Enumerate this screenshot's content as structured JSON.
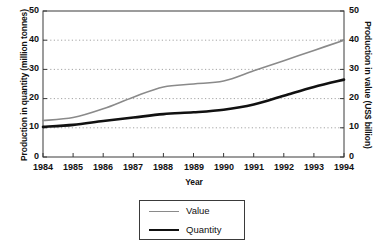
{
  "chart_data": {
    "type": "line",
    "title": "",
    "xlabel": "Year",
    "ylabel": "Production in quantity (million tonnes)",
    "ylabel_right": "Production in value (US$ billion)",
    "categories": [
      "1984",
      "1985",
      "1986",
      "1987",
      "1988",
      "1989",
      "1990",
      "1991",
      "1992",
      "1993",
      "1994"
    ],
    "x": [
      1984,
      1985,
      1986,
      1987,
      1988,
      1989,
      1990,
      1991,
      1992,
      1993,
      1994
    ],
    "xlim": [
      1984,
      1994
    ],
    "ylim": [
      0,
      50
    ],
    "ylim_right": [
      0,
      50
    ],
    "yticks": [
      0,
      10,
      20,
      30,
      40,
      50
    ],
    "yticks_right": [
      0,
      10,
      20,
      30,
      40,
      50
    ],
    "grid": true,
    "grid_style": "dotted-horizontal",
    "legend_position": "below-axes-center",
    "series": [
      {
        "name": "Value",
        "axis": "right",
        "unit": "US$ billion",
        "color": "#8a8a8a",
        "width": 1.6,
        "values": [
          12.5,
          13.5,
          16.5,
          20.5,
          24.0,
          25.0,
          26.0,
          29.5,
          33.0,
          36.5,
          40.0
        ]
      },
      {
        "name": "Quantity",
        "axis": "left",
        "unit": "million tonnes",
        "color": "#111111",
        "width": 2.6,
        "values": [
          10.3,
          11.0,
          12.3,
          13.5,
          14.7,
          15.3,
          16.2,
          18.0,
          21.0,
          24.0,
          26.5
        ]
      }
    ]
  },
  "axes": {
    "left_title": "Production in quantity (million tonnes)",
    "right_title": "Production in value (US$ billion)",
    "x_title": "Year",
    "left_ticks": [
      "50",
      "40",
      "30",
      "20",
      "10",
      "0"
    ],
    "right_ticks": [
      "50",
      "40",
      "30",
      "20",
      "10",
      "0"
    ],
    "x_ticks": [
      "1984",
      "1985",
      "1986",
      "1987",
      "1988",
      "1989",
      "1990",
      "1991",
      "1992",
      "1993",
      "1994"
    ]
  },
  "legend": {
    "items": [
      {
        "label": "Value",
        "color": "#8a8a8a"
      },
      {
        "label": "Quantity",
        "color": "#111111"
      }
    ]
  },
  "colors": {
    "value_line": "#8a8a8a",
    "quantity_line": "#111111",
    "frame": "#3a3a3a",
    "grid": "#9a9a9a",
    "background": "#ffffff"
  }
}
